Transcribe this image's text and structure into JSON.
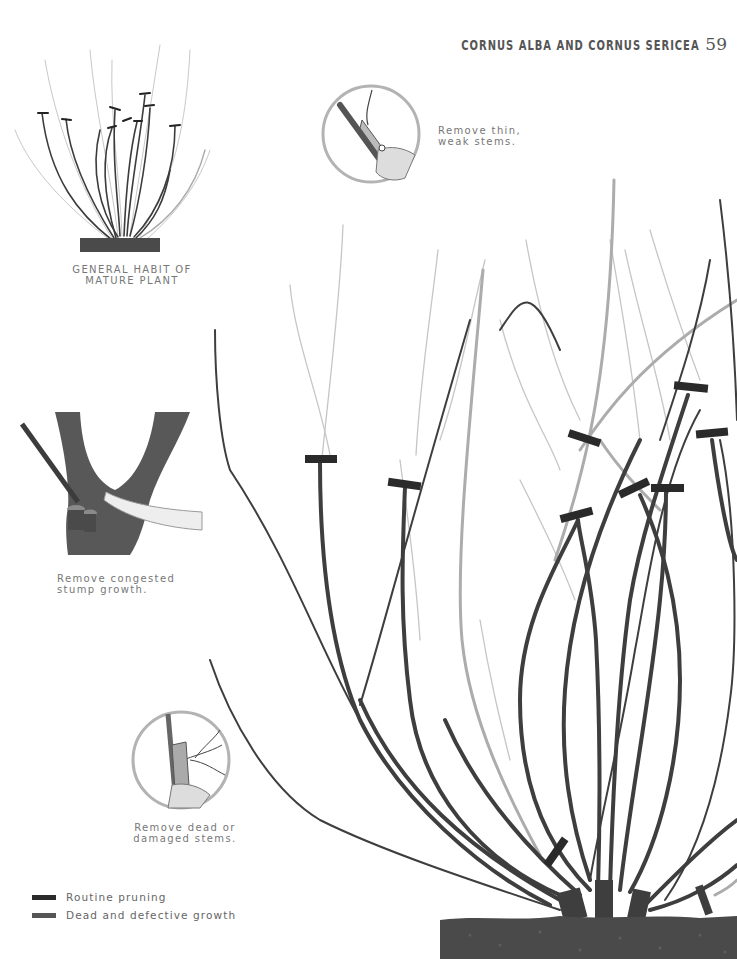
{
  "header": {
    "title": "CORNUS ALBA AND CORNUS SERICEA",
    "page_number": "59"
  },
  "illustrations": {
    "habit": {
      "caption_line1": "GENERAL HABIT OF",
      "caption_line2": "MATURE PLANT"
    },
    "thin_stems": {
      "caption_line1": "Remove thin,",
      "caption_line2": "weak stems."
    },
    "stump": {
      "caption_line1": "Remove congested",
      "caption_line2": "stump growth."
    },
    "dead_stems": {
      "caption_line1": "Remove dead or",
      "caption_line2": "damaged stems."
    }
  },
  "legend": {
    "items": [
      {
        "label": "Routine pruning",
        "color": "#2b2b2b"
      },
      {
        "label": "Dead and defective growth",
        "color": "#555555"
      }
    ]
  },
  "colors": {
    "stem_dark": "#3a3a3a",
    "stem_light": "#a8a8a8",
    "cut_mark": "#2a2a2a",
    "soil": "#4a4a4a",
    "circle_outline": "#b0b0b0"
  }
}
